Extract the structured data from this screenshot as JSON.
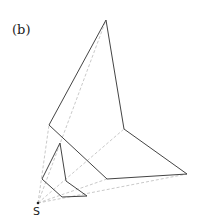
{
  "figure": {
    "label": "(b)",
    "point_label": "S",
    "colors": {
      "solid": "#444444",
      "dashed": "#bbbbbb"
    },
    "source_point": [
      38,
      203
    ],
    "large_polygon": [
      [
        106,
        20
      ],
      [
        49,
        125
      ],
      [
        107,
        179
      ],
      [
        187,
        174
      ],
      [
        124,
        129
      ]
    ],
    "small_polygon": [
      [
        60,
        143
      ],
      [
        42,
        179
      ],
      [
        62,
        197
      ],
      [
        87,
        196
      ],
      [
        66,
        181
      ]
    ]
  }
}
